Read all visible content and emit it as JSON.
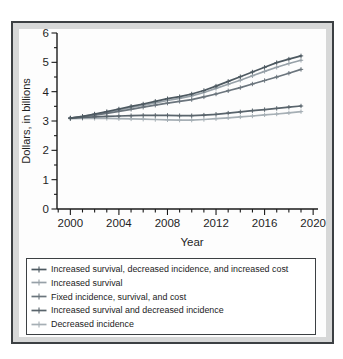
{
  "figure": {
    "frame_background": "#d7d8d8",
    "frame_border_color": "#3c4043",
    "panel_background": "#fdfdfd"
  },
  "chart_data": {
    "type": "line",
    "title": "",
    "xlabel": "Year",
    "ylabel": "Dollars, in billions",
    "xlim": [
      1998.9,
      2020.4
    ],
    "ylim": [
      0,
      6
    ],
    "x_ticks_major": [
      2000,
      2004,
      2008,
      2012,
      2016,
      2020
    ],
    "x_minor_step": 1,
    "y_ticks_major": [
      0,
      1,
      2,
      3,
      4,
      5,
      6
    ],
    "y_minor_step": 0.5,
    "grid": false,
    "legend_position": "bottom",
    "x": [
      2000,
      2001,
      2002,
      2003,
      2004,
      2005,
      2006,
      2007,
      2008,
      2009,
      2010,
      2011,
      2012,
      2013,
      2014,
      2015,
      2016,
      2017,
      2018,
      2019
    ],
    "series": [
      {
        "name": "Increased survival, decreased incidence, and increased cost",
        "color": "#4d5961",
        "values": [
          3.1,
          3.16,
          3.24,
          3.32,
          3.41,
          3.5,
          3.58,
          3.67,
          3.76,
          3.83,
          3.92,
          4.04,
          4.19,
          4.35,
          4.51,
          4.67,
          4.83,
          4.99,
          5.11,
          5.22
        ]
      },
      {
        "name": "Increased survival",
        "color": "#97a1a8",
        "values": [
          3.1,
          3.15,
          3.22,
          3.3,
          3.38,
          3.46,
          3.54,
          3.62,
          3.7,
          3.77,
          3.86,
          3.97,
          4.11,
          4.25,
          4.39,
          4.54,
          4.69,
          4.83,
          4.96,
          5.07
        ]
      },
      {
        "name": "Fixed incidence, survival, and cost",
        "color": "#6b757d",
        "values": [
          3.1,
          3.14,
          3.2,
          3.26,
          3.33,
          3.4,
          3.47,
          3.54,
          3.61,
          3.67,
          3.73,
          3.82,
          3.92,
          4.03,
          4.14,
          4.26,
          4.38,
          4.5,
          4.63,
          4.76
        ]
      },
      {
        "name": "Increased survival and decreased incidence",
        "color": "#59646c",
        "values": [
          3.1,
          3.12,
          3.14,
          3.16,
          3.17,
          3.18,
          3.19,
          3.19,
          3.19,
          3.18,
          3.18,
          3.2,
          3.23,
          3.27,
          3.31,
          3.35,
          3.39,
          3.43,
          3.47,
          3.51
        ]
      },
      {
        "name": "Decreased incidence",
        "color": "#a6afb5",
        "values": [
          3.08,
          3.09,
          3.09,
          3.09,
          3.08,
          3.07,
          3.06,
          3.05,
          3.04,
          3.03,
          3.03,
          3.05,
          3.08,
          3.11,
          3.14,
          3.17,
          3.21,
          3.24,
          3.28,
          3.32
        ]
      }
    ]
  }
}
